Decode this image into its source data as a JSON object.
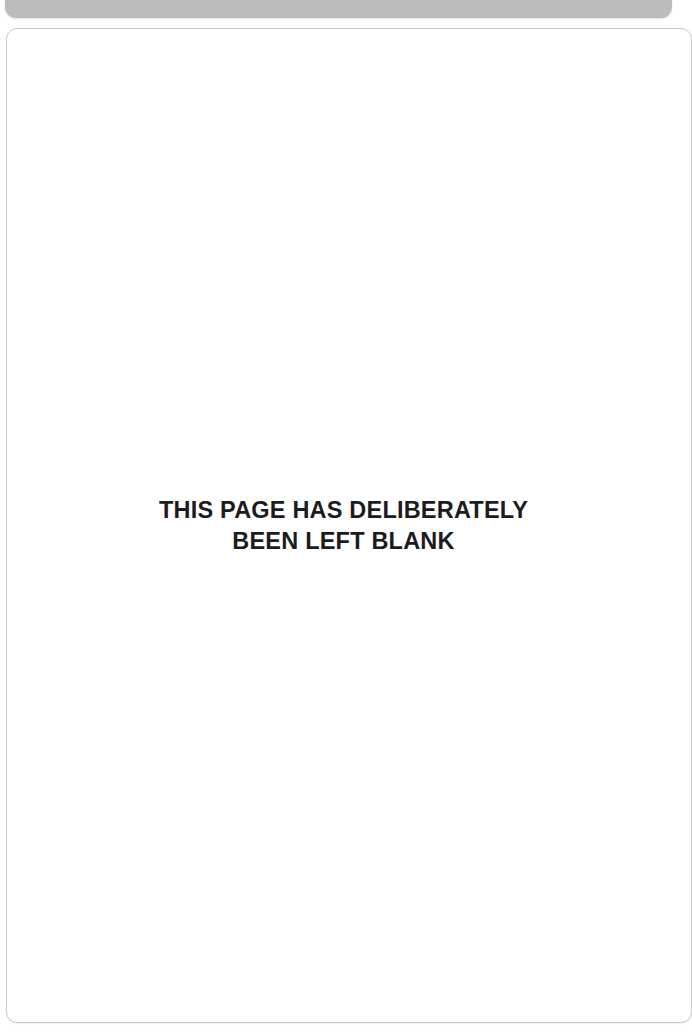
{
  "viewer": {
    "background_color": "#ffffff"
  },
  "previous_page": {
    "name": "previous-page-bottom-edge",
    "color": "#bcbcbc"
  },
  "page": {
    "background_color": "#ffffff",
    "border_color": "#c9c9c9",
    "notice": {
      "text_color": "#1c1c20",
      "line1": "THIS PAGE HAS DELIBERATELY",
      "line2": "BEEN LEFT BLANK"
    }
  }
}
